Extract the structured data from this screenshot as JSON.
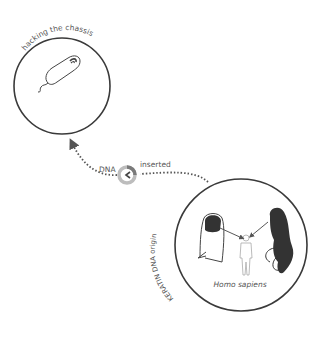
{
  "nodes": {
    "chassis": {
      "label": "hacking the chassis",
      "organism_icon": "bacterium-icon"
    },
    "origin": {
      "label": "KERATIN DNA origin",
      "species": "Homo sapiens",
      "items": [
        "fingernail-icon",
        "human-figure-icon",
        "hair-icon"
      ]
    }
  },
  "connector": {
    "left_label": "DNA",
    "right_label": "inserted",
    "hub_icon": "insertion-ring-icon"
  },
  "colors": {
    "stroke": "#3a3a3a",
    "dots": "#555555",
    "ring_light": "#bdbdbd",
    "ring_dark": "#7a7a7a",
    "text": "#555555"
  }
}
